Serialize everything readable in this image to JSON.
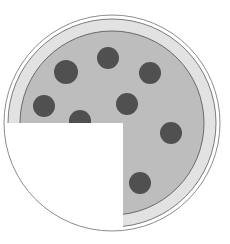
{
  "diagram": {
    "canvas": {
      "width": 230,
      "height": 244,
      "background": "#ffffff"
    },
    "center": {
      "x": 112,
      "y": 123
    },
    "rings": {
      "outer_outline": {
        "r": 108,
        "stroke": "#8c8c8c"
      },
      "crust": {
        "r": 104,
        "fill": "#e2e2e2",
        "stroke": "#7a7a7a"
      },
      "sauce": {
        "r": 92,
        "fill": "#bdbdbd",
        "stroke": "#6a6a6a"
      }
    },
    "missing_slice": {
      "label": "one quarter removed",
      "x": 6,
      "y": 123,
      "width": 117,
      "height": 121,
      "fill": "#ffffff"
    },
    "pepperoni": {
      "fill": "#505050",
      "items": [
        {
          "x": 66,
          "y": 72,
          "r": 12
        },
        {
          "x": 108,
          "y": 58,
          "r": 11
        },
        {
          "x": 150,
          "y": 73,
          "r": 11
        },
        {
          "x": 44,
          "y": 106,
          "r": 11
        },
        {
          "x": 127,
          "y": 104,
          "r": 11
        },
        {
          "x": 80,
          "y": 121,
          "r": 11
        },
        {
          "x": 171,
          "y": 133,
          "r": 11
        },
        {
          "x": 140,
          "y": 183,
          "r": 11
        }
      ]
    },
    "fraction_shown": {
      "remaining": "3/4",
      "removed": "1/4"
    }
  }
}
